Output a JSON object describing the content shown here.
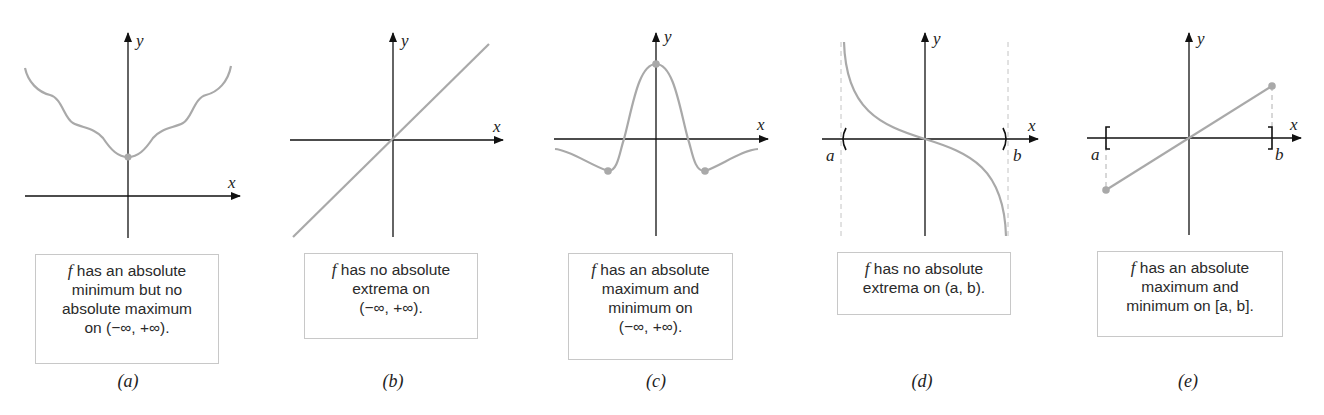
{
  "figure": {
    "colors": {
      "curve": "#a9a9a9",
      "axis": "#111111",
      "box_border": "#c8c8c8",
      "text": "#2a2a2a"
    },
    "axis_labels": {
      "x": "x",
      "y": "y",
      "a": "a",
      "b": "b"
    },
    "panels": [
      {
        "id": "a",
        "caption": "(a)",
        "f": "f",
        "lines": [
          "has an absolute",
          "minimum but no",
          "absolute maximum",
          "on (−∞, +∞)."
        ]
      },
      {
        "id": "b",
        "caption": "(b)",
        "f": "f",
        "lines": [
          "has no absolute",
          "extrema on",
          "(−∞, +∞)."
        ]
      },
      {
        "id": "c",
        "caption": "(c)",
        "f": "f",
        "lines": [
          "has an absolute",
          "maximum and",
          "minimum on",
          "(−∞, +∞)."
        ]
      },
      {
        "id": "d",
        "caption": "(d)",
        "f": "f",
        "lines": [
          "has no absolute",
          "extrema on (a, b)."
        ]
      },
      {
        "id": "e",
        "caption": "(e)",
        "f": "f",
        "lines": [
          "has an absolute",
          "maximum and",
          "minimum on [a, b]."
        ]
      }
    ]
  }
}
